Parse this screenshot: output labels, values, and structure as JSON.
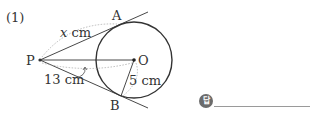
{
  "problem": {
    "number": "(1)",
    "answer_badge": "답"
  },
  "points": {
    "P": "P",
    "O": "O",
    "A": "A",
    "B": "B"
  },
  "labels": {
    "PA": "x cm",
    "PA_var": "x",
    "PA_unit": " cm",
    "PO": "13 cm",
    "OB": "5 cm"
  },
  "colors": {
    "line": "#333333",
    "dotted": "#999999",
    "answer_badge": "#6b6b6b"
  }
}
